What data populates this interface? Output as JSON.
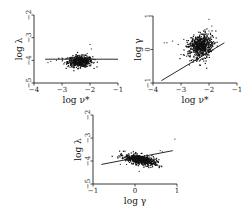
{
  "chart_data": [
    {
      "id": "p1",
      "type": "scatter",
      "xlabel": "log ν*",
      "ylabel": "log λ",
      "xlim": [
        -4,
        -1
      ],
      "ylim": [
        -5,
        -2
      ],
      "xticks": [
        -4,
        -3,
        -2,
        -1
      ],
      "yticks": [
        -5,
        -4,
        -3,
        -2
      ],
      "frame": {
        "x0": 34,
        "x1": 118,
        "y0": 83,
        "y1": 15
      },
      "cluster": {
        "cx": -2.35,
        "cy": -4.05,
        "sx": 0.22,
        "sy": 0.12,
        "n": 520,
        "rot": 0.0
      },
      "outliers": [
        [
          -3.5,
          -4.1
        ],
        [
          -3.4,
          -4.05
        ],
        [
          -3.2,
          -4.0
        ],
        [
          -3.0,
          -3.9
        ],
        [
          -2.9,
          -4.1
        ],
        [
          -2.5,
          -3.75
        ],
        [
          -2.1,
          -3.7
        ],
        [
          -2.0,
          -3.3
        ],
        [
          -1.95,
          -3.5
        ],
        [
          -2.4,
          -4.35
        ],
        [
          -2.6,
          -4.3
        ]
      ],
      "fit_line": [
        [
          -3.6,
          -3.95
        ],
        [
          -1.0,
          -3.95
        ]
      ]
    },
    {
      "id": "p2",
      "type": "scatter",
      "xlabel": "log ν*",
      "ylabel": "log γ",
      "xlim": [
        -4,
        -1
      ],
      "ylim": [
        -1,
        1
      ],
      "xticks": [
        -4,
        -3,
        -2,
        -1
      ],
      "yticks": [
        -1,
        0,
        1
      ],
      "frame": {
        "x0": 153,
        "x1": 237,
        "y0": 83,
        "y1": 16
      },
      "cluster": {
        "cx": -2.3,
        "cy": 0.1,
        "sx": 0.22,
        "sy": 0.17,
        "n": 650,
        "rot": 0.5
      },
      "outliers": [
        [
          -3.6,
          0.2
        ],
        [
          -3.5,
          0.2
        ],
        [
          -3.3,
          0.25
        ],
        [
          -3.1,
          0.15
        ],
        [
          -3.0,
          -0.15
        ],
        [
          -2.9,
          0.3
        ],
        [
          -2.8,
          -0.2
        ],
        [
          -2.0,
          0.9
        ],
        [
          -1.9,
          0.7
        ],
        [
          -2.0,
          0.55
        ],
        [
          -2.6,
          -0.3
        ],
        [
          -2.5,
          -0.25
        ]
      ],
      "fit_line": [
        [
          -3.7,
          -0.93
        ],
        [
          -1.45,
          0.2
        ]
      ]
    },
    {
      "id": "p3",
      "type": "scatter",
      "xlabel": "log γ",
      "ylabel": "log λ",
      "xlim": [
        -1,
        1
      ],
      "ylim": [
        -5,
        -2
      ],
      "xticks": [
        -1,
        0,
        1
      ],
      "yticks": [
        -5,
        -4,
        -3,
        -2
      ],
      "frame": {
        "x0": 93,
        "x1": 177,
        "y0": 184,
        "y1": 115
      },
      "cluster": {
        "cx": 0.12,
        "cy": -3.95,
        "sx": 0.2,
        "sy": 0.1,
        "n": 560,
        "rot": -0.45
      },
      "outliers": [
        [
          -0.35,
          -4.15
        ],
        [
          -0.2,
          -4.15
        ],
        [
          0.1,
          -4.45
        ],
        [
          0.6,
          -3.55
        ],
        [
          0.65,
          -3.6
        ],
        [
          0.95,
          -3.05
        ],
        [
          -0.3,
          -3.85
        ]
      ],
      "fit_line": [
        [
          -0.8,
          -4.15
        ],
        [
          0.9,
          -3.55
        ]
      ]
    }
  ]
}
